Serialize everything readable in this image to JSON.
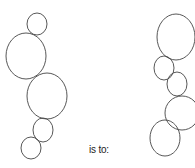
{
  "analogy": {
    "connector_text": "is to:",
    "stroke_color": "#444444",
    "left_figure": {
      "circles": [
        {
          "cx": 37,
          "cy": 24,
          "rx": 10,
          "ry": 11
        },
        {
          "cx": 26,
          "cy": 56,
          "rx": 20,
          "ry": 23
        },
        {
          "cx": 47,
          "cy": 96,
          "rx": 20,
          "ry": 23
        },
        {
          "cx": 43,
          "cy": 130,
          "rx": 10,
          "ry": 12
        },
        {
          "cx": 31,
          "cy": 148,
          "rx": 10,
          "ry": 11
        }
      ]
    },
    "right_figure": {
      "circles": [
        {
          "cx": 176,
          "cy": 37,
          "rx": 19,
          "ry": 23
        },
        {
          "cx": 164,
          "cy": 68,
          "rx": 10,
          "ry": 12
        },
        {
          "cx": 177,
          "cy": 84,
          "rx": 10,
          "ry": 12
        },
        {
          "cx": 182,
          "cy": 113,
          "rx": 17,
          "ry": 17
        },
        {
          "cx": 165,
          "cy": 138,
          "rx": 15,
          "ry": 18
        }
      ]
    }
  }
}
